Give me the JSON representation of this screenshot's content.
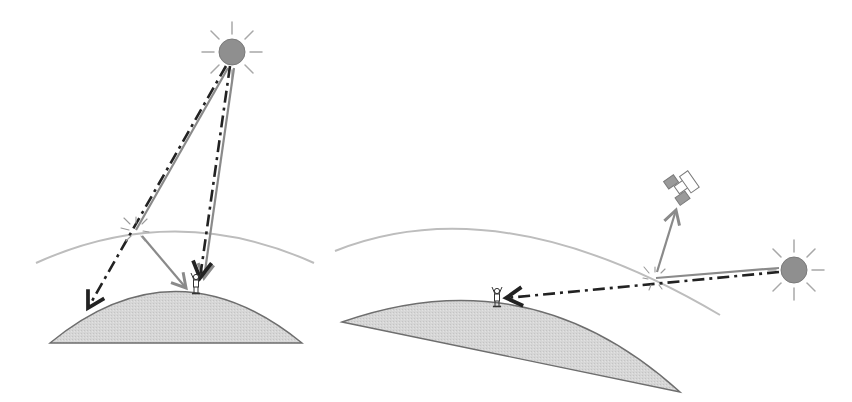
{
  "diagram": {
    "title": "Sunlight scattering in the atmosphere: high sun vs. low sun",
    "colors": {
      "background": "#ffffff",
      "sun_fill": "#8f8f8f",
      "sun_rays": "#a0a0a0",
      "earth_fill": "#d4d4d4",
      "earth_stroke": "#6a6a6a",
      "atmosphere": "#b8b8b8",
      "scattered_ray": "#8a8a8a",
      "direct_ray": "#333333"
    },
    "legend_semantics": {
      "solid_gray_line": "scattered / diffuse light",
      "dash_dot_black_line": "direct light reaching the surface"
    },
    "panels": [
      {
        "id": "left",
        "label": "High sun (short atmospheric path)",
        "elements": [
          "sun",
          "atmosphere-arc",
          "earth-surface",
          "observer",
          "scatter-point",
          "direct-ray-to-observer",
          "direct-ray-to-ground",
          "scattered-ray-to-observer"
        ]
      },
      {
        "id": "right",
        "label": "Low sun (long atmospheric path)",
        "elements": [
          "sun",
          "atmosphere-arc",
          "earth-surface",
          "observer",
          "satellite",
          "scatter-point",
          "direct-ray-to-observer",
          "scattered-ray-to-satellite"
        ]
      }
    ]
  }
}
